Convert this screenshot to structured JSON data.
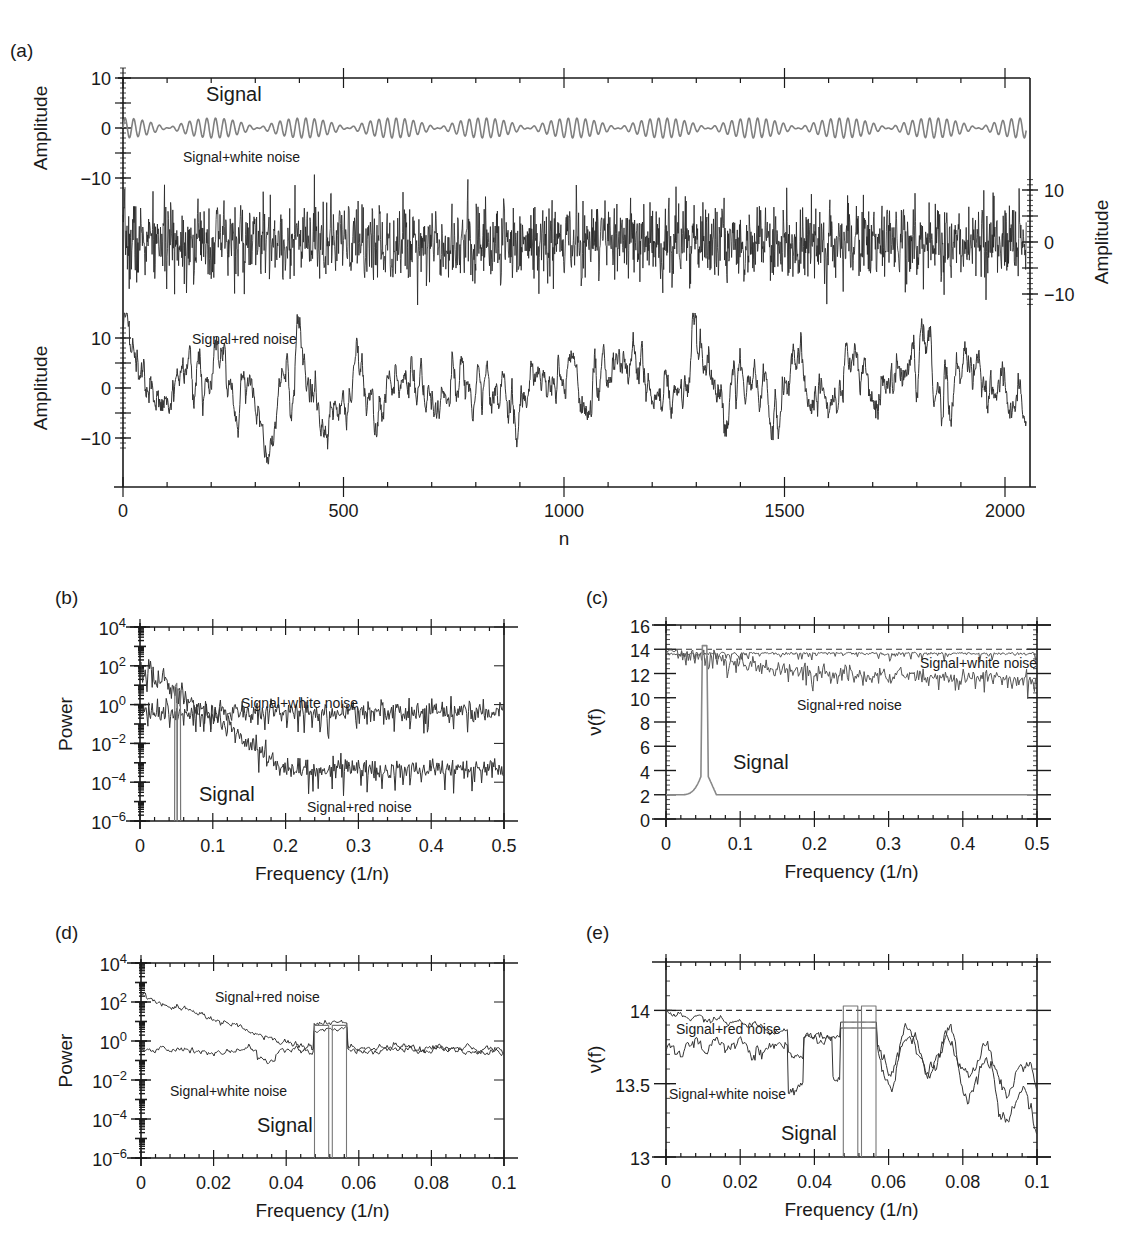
{
  "figure": {
    "panels": [
      "(a)",
      "(b)",
      "(c)",
      "(d)",
      "(e)"
    ]
  },
  "chart_data": [
    {
      "id": "a",
      "panel_label": "(a)",
      "type": "line",
      "title": "",
      "xlabel": "n",
      "ylabel_left": "Amplitude",
      "ylabel_right": "Amplitude",
      "xlim": [
        0,
        2048
      ],
      "xticks": [
        0,
        500,
        1000,
        1500,
        2000
      ],
      "xtick_labels": [
        "0",
        "500",
        "1000",
        "1500",
        "2000"
      ],
      "sub_axes": [
        {
          "name": "Signal",
          "side": "left",
          "yticks": [
            10,
            0,
            -10
          ],
          "ytick_labels": [
            "10",
            "0",
            "−10"
          ]
        },
        {
          "name": "Signal+white noise",
          "side": "right",
          "yticks": [
            10,
            0,
            -10
          ],
          "ytick_labels": [
            "10",
            "0",
            "−10"
          ]
        },
        {
          "name": "Signal+red noise",
          "side": "left",
          "yticks": [
            10,
            0,
            -10
          ],
          "ytick_labels": [
            "10",
            "0",
            "−10"
          ]
        }
      ],
      "series": [
        {
          "name": "Signal",
          "color": "#808080",
          "description": "beating sinusoid, amplitude ~2, carrier freq ~0.05 cycles/sample, envelope period ~205 samples",
          "amplitude": 2,
          "frequencies": [
            0.0488,
            0.0537
          ]
        },
        {
          "name": "Signal+white noise",
          "color": "#222222",
          "range_approx": [
            -12,
            13
          ]
        },
        {
          "name": "Signal+red noise",
          "color": "#333333",
          "range_approx": [
            -16,
            15
          ]
        }
      ],
      "annotations": [
        "Signal",
        "Signal+white noise",
        "Signal+red noise"
      ]
    },
    {
      "id": "b",
      "panel_label": "(b)",
      "type": "line",
      "xlabel": "Frequency (1/n)",
      "ylabel": "Power",
      "xlim": [
        0,
        0.5
      ],
      "ylim_log10": [
        -6,
        4
      ],
      "yscale": "log",
      "xticks": [
        0,
        0.1,
        0.2,
        0.3,
        0.4,
        0.5
      ],
      "xtick_labels": [
        "0",
        "0.1",
        "0.2",
        "0.3",
        "0.4",
        "0.5"
      ],
      "yticks_exp": [
        4,
        2,
        0,
        -2,
        -4,
        -6
      ],
      "series": [
        {
          "name": "Signal+white noise",
          "color": "#333333",
          "level_log10_approx": -0.5
        },
        {
          "name": "Signal+red noise",
          "color": "#333333",
          "start_log10": 2,
          "end_log10": -3.5
        },
        {
          "name": "Signal",
          "color": "#777777",
          "peaks_at": [
            0.0488,
            0.0537
          ],
          "peak_log10": 1
        }
      ],
      "annotations": [
        "Signal+white noise",
        "Signal",
        "Signal+red noise"
      ]
    },
    {
      "id": "c",
      "panel_label": "(c)",
      "type": "line",
      "xlabel": "Frequency (1/n)",
      "ylabel": "ν(f)",
      "xlim": [
        0,
        0.5
      ],
      "ylim": [
        0,
        16
      ],
      "xticks": [
        0,
        0.1,
        0.2,
        0.3,
        0.4,
        0.5
      ],
      "xtick_labels": [
        "0",
        "0.1",
        "0.2",
        "0.3",
        "0.4",
        "0.5"
      ],
      "yticks": [
        0,
        2,
        4,
        6,
        8,
        10,
        12,
        14,
        16
      ],
      "ytick_labels": [
        "0",
        "2",
        "4",
        "6",
        "8",
        "10",
        "12",
        "14",
        "16"
      ],
      "reference_line": {
        "y": 14,
        "style": "dashed"
      },
      "series": [
        {
          "name": "Signal+white noise",
          "color": "#555555",
          "level_approx": 13.7
        },
        {
          "name": "Signal+red noise",
          "color": "#555555",
          "start": 13.8,
          "end_approx": 11.5
        },
        {
          "name": "Signal",
          "color": "#888888",
          "baseline": 2,
          "peak": 14.3,
          "peak_at": [
            0.049,
            0.054
          ]
        }
      ],
      "annotations": [
        "Signal+white noise",
        "Signal+red noise",
        "Signal"
      ]
    },
    {
      "id": "d",
      "panel_label": "(d)",
      "type": "line",
      "xlabel": "Frequency (1/n)",
      "ylabel": "Power",
      "xlim": [
        0,
        0.1
      ],
      "ylim_log10": [
        -6,
        4
      ],
      "yscale": "log",
      "xticks": [
        0,
        0.02,
        0.04,
        0.06,
        0.08,
        0.1
      ],
      "xtick_labels": [
        "0",
        "0.02",
        "0.04",
        "0.06",
        "0.08",
        "0.1"
      ],
      "yticks_exp": [
        4,
        2,
        0,
        -2,
        -4,
        -6
      ],
      "series": [
        {
          "name": "Signal+red noise",
          "color": "#333333",
          "start_log10": 2.3,
          "end_log10": -1.2
        },
        {
          "name": "Signal+white noise",
          "color": "#333333",
          "level_log10_approx": -0.5
        },
        {
          "name": "Signal",
          "color": "#777777",
          "bands": [
            [
              0.0478,
              0.0517
            ],
            [
              0.0527,
              0.0566
            ]
          ],
          "peak_log10": 1
        }
      ],
      "annotations": [
        "Signal+red noise",
        "Signal+white noise",
        "Signal"
      ]
    },
    {
      "id": "e",
      "panel_label": "(e)",
      "type": "line",
      "xlabel": "Frequency (1/n)",
      "ylabel": "ν(f)",
      "xlim": [
        0,
        0.1
      ],
      "ylim": [
        13,
        14.33
      ],
      "xticks": [
        0,
        0.02,
        0.04,
        0.06,
        0.08,
        0.1
      ],
      "xtick_labels": [
        "0",
        "0.02",
        "0.04",
        "0.06",
        "0.08",
        "0.1"
      ],
      "yticks": [
        13,
        13.5,
        14
      ],
      "ytick_labels": [
        "13",
        "13.5",
        "14"
      ],
      "reference_line": {
        "y": 14,
        "style": "dashed"
      },
      "series": [
        {
          "name": "Signal+red noise",
          "color": "#333333",
          "start": 13.99,
          "min_approx": 13.1
        },
        {
          "name": "Signal+white noise",
          "color": "#333333",
          "start": 13.8,
          "min_approx": 13.1
        },
        {
          "name": "Signal",
          "color": "#777777",
          "bands": [
            [
              0.0478,
              0.0517
            ],
            [
              0.0527,
              0.0566
            ]
          ],
          "peak": 14.0
        }
      ],
      "annotations": [
        "Signal+red noise",
        "Signal+white noise",
        "Signal"
      ]
    }
  ]
}
